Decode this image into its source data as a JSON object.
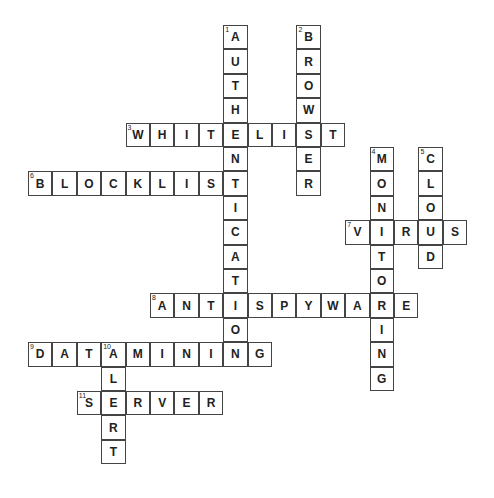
{
  "puzzle": {
    "type": "crossword",
    "grid": {
      "origin_x": 28,
      "origin_y": 25,
      "cell_size": 24.4
    },
    "words": [
      {
        "number": "1",
        "answer": "AUTHENTICATION",
        "direction": "down",
        "row": 0,
        "col": 8
      },
      {
        "number": "2",
        "answer": "BROWSER",
        "direction": "down",
        "row": 0,
        "col": 11
      },
      {
        "number": "3",
        "answer": "WHITELIST",
        "direction": "across",
        "row": 4,
        "col": 4
      },
      {
        "number": "4",
        "answer": "MONITORING",
        "direction": "down",
        "row": 5,
        "col": 14
      },
      {
        "number": "5",
        "answer": "CLOUD",
        "direction": "down",
        "row": 5,
        "col": 16
      },
      {
        "number": "6",
        "answer": "BLOCKLIST",
        "direction": "across",
        "row": 6,
        "col": 0
      },
      {
        "number": "7",
        "answer": "VIRUS",
        "direction": "across",
        "row": 8,
        "col": 13
      },
      {
        "number": "8",
        "answer": "ANTISPYWARE",
        "direction": "across",
        "row": 11,
        "col": 5
      },
      {
        "number": "9",
        "answer": "DATAMINING",
        "direction": "across",
        "row": 13,
        "col": 0
      },
      {
        "number": "10",
        "answer": "ALERT",
        "direction": "down",
        "row": 13,
        "col": 3
      },
      {
        "number": "11",
        "answer": "SERVER",
        "direction": "across",
        "row": 15,
        "col": 2
      }
    ]
  }
}
